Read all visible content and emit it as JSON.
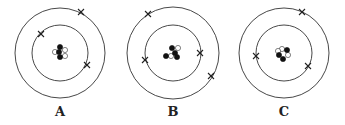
{
  "diagram": {
    "type": "bohr-atom-models",
    "atoms": [
      {
        "label": "A",
        "center": [
          60,
          53
        ],
        "orbit_radii": [
          28,
          45
        ],
        "nucleus": {
          "protons": [
            [
              60,
              47
            ],
            [
              59,
              52
            ],
            [
              60,
              57
            ]
          ],
          "neutrons": [
            [
              55,
              52
            ],
            [
              65,
              50
            ],
            [
              65,
              56
            ]
          ]
        },
        "electrons": [
          [
            41,
            34
          ],
          [
            87,
            65
          ],
          [
            81,
            12
          ]
        ]
      },
      {
        "label": "B",
        "center": [
          173,
          53
        ],
        "orbit_radii": [
          28,
          46
        ],
        "nucleus": {
          "protons": [
            [
              172,
              48
            ],
            [
              175,
              53
            ],
            [
              166,
              56
            ],
            [
              177,
              57
            ]
          ],
          "neutrons": [
            [
              178,
              48
            ],
            [
              171,
              56
            ]
          ]
        },
        "electrons": [
          [
            145,
            60
          ],
          [
            200,
            53
          ],
          [
            148,
            14
          ],
          [
            211,
            76
          ]
        ]
      },
      {
        "label": "C",
        "center": [
          284,
          53
        ],
        "orbit_radii": [
          28,
          45
        ],
        "nucleus": {
          "protons": [
            [
              287,
              50
            ],
            [
              279,
              55
            ],
            [
              283,
              59
            ]
          ],
          "neutrons": [
            [
              282,
              49
            ],
            [
              278,
              51
            ],
            [
              288,
              55
            ]
          ]
        },
        "electrons": [
          [
            256,
            56
          ],
          [
            308,
            66
          ],
          [
            302,
            12
          ]
        ]
      }
    ],
    "colors": {
      "orbit": "#333333",
      "proton": "#111111",
      "neutron": "#ffffff",
      "electron": "#222222"
    }
  },
  "labels": {
    "a": "A",
    "b": "B",
    "c": "C"
  }
}
